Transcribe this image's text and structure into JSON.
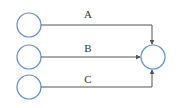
{
  "diagram": {
    "colors": {
      "node_stroke": "#5b8fd0",
      "edge": "#555555",
      "label": "#333333"
    },
    "nodes": [
      {
        "id": "src-a",
        "cx": 29,
        "cy": 25,
        "r": 12
      },
      {
        "id": "src-b",
        "cx": 29,
        "cy": 57,
        "r": 12
      },
      {
        "id": "src-c",
        "cx": 29,
        "cy": 87,
        "r": 12
      },
      {
        "id": "target",
        "cx": 153,
        "cy": 57,
        "r": 12
      }
    ],
    "edges": [
      {
        "label": "A",
        "from": "src-a",
        "to": "target"
      },
      {
        "label": "B",
        "from": "src-b",
        "to": "target"
      },
      {
        "label": "C",
        "from": "src-c",
        "to": "target"
      }
    ]
  }
}
